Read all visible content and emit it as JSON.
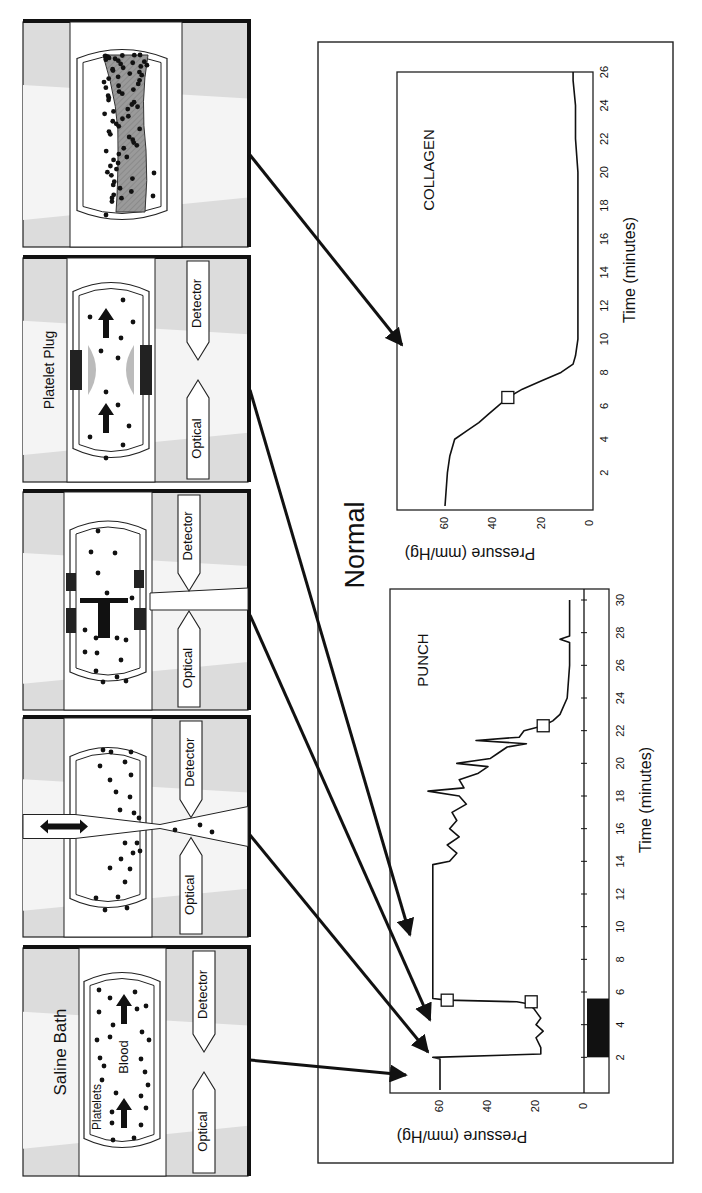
{
  "figure": {
    "group_label": "Normal",
    "orientation": "rotated 90 degrees clockwise"
  },
  "panels": [
    {
      "id": "saline-bath",
      "title": "Saline Bath",
      "labels": [
        "Platelets",
        "Blood"
      ],
      "optical_label": "Optical",
      "detector_label": "Detector"
    },
    {
      "id": "punch",
      "title": "",
      "optical_label": "Optical",
      "detector_label": "Detector"
    },
    {
      "id": "adhesion",
      "title": "",
      "optical_label": "Optical",
      "detector_label": "Detector"
    },
    {
      "id": "platelet-plug",
      "title": "Platelet Plug",
      "optical_label": "Optical",
      "detector_label": "Detector"
    },
    {
      "id": "collagen-thrombus",
      "title": ""
    }
  ],
  "chart_data": [
    {
      "type": "line",
      "title": "PUNCH",
      "xlabel": "Time (minutes)",
      "ylabel": "Pressure (mm/Hg)",
      "xticks": [
        "2",
        "4",
        "6",
        "8",
        "10",
        "12",
        "14",
        "16",
        "18",
        "20",
        "22",
        "24",
        "26",
        "28",
        "30"
      ],
      "yticks": [
        "0",
        "20",
        "40",
        "60"
      ],
      "xlim": [
        0,
        30
      ],
      "ylim": [
        -8,
        75
      ],
      "series": [
        {
          "name": "Pressure",
          "x": [
            0,
            1.9,
            2.0,
            2.2,
            2.6,
            3.2,
            3.6,
            4.0,
            4.4,
            4.8,
            5.0,
            5.3,
            5.4,
            5.5,
            5.6,
            13.8,
            14.0,
            14.5,
            15.0,
            15.5,
            16.0,
            16.5,
            17.0,
            17.5,
            18.0,
            18.3,
            18.5,
            19.0,
            19.4,
            19.8,
            20.0,
            20.3,
            20.6,
            21.0,
            21.2,
            21.4,
            21.6,
            21.8,
            22.0,
            22.3,
            22.6,
            23.0,
            24.0,
            26.0,
            27.4,
            27.6,
            27.8,
            28.0,
            30.0
          ],
          "y": [
            60,
            60,
            63,
            18,
            18,
            20,
            17,
            20,
            18,
            20,
            21,
            24,
            28,
            57,
            63,
            63,
            56,
            53,
            57,
            52,
            56,
            53,
            55,
            49,
            52,
            65,
            50,
            52,
            44,
            40,
            53,
            39,
            36,
            32,
            24,
            45,
            27,
            26,
            25,
            17,
            13,
            10,
            7,
            6,
            6,
            10,
            6,
            6,
            6
          ]
        },
        {
          "name": "Baseline",
          "x": [
            0,
            30
          ],
          "y": [
            0,
            0
          ]
        }
      ],
      "markers": [
        {
          "x": 5.4,
          "y": 22
        },
        {
          "x": 5.5,
          "y": 57
        },
        {
          "x": 22.3,
          "y": 17
        }
      ],
      "annotation_bar": {
        "x_start": 2,
        "x_end": 5.6,
        "color": "#111111"
      }
    },
    {
      "type": "line",
      "title": "COLLAGEN",
      "xlabel": "Time (minutes)",
      "ylabel": "Pressure (mm/Hg)",
      "xticks": [
        "2",
        "4",
        "6",
        "8",
        "10",
        "12",
        "14",
        "16",
        "18",
        "20",
        "22",
        "24",
        "26"
      ],
      "yticks": [
        "0",
        "20",
        "40",
        "60"
      ],
      "xlim": [
        0,
        26
      ],
      "ylim": [
        0,
        75
      ],
      "series": [
        {
          "name": "Pressure",
          "x": [
            0,
            2,
            3,
            4,
            4.5,
            5,
            5.5,
            6,
            6.5,
            7,
            7.5,
            8,
            8.5,
            9,
            10,
            14,
            18,
            20,
            22,
            24,
            25.5,
            26
          ],
          "y": [
            60,
            59,
            58,
            56,
            51,
            46,
            42,
            38,
            34,
            28,
            20,
            12,
            7,
            6,
            5,
            5,
            5,
            5,
            6,
            6,
            7,
            7
          ]
        }
      ],
      "markers": [
        {
          "x": 6.5,
          "y": 34
        }
      ]
    }
  ],
  "colors": {
    "ink": "#111111",
    "panel_gray": "#d9d9d9",
    "plug_gray": "#a8a8a8",
    "thrombus_gray": "#8f8f8f"
  }
}
